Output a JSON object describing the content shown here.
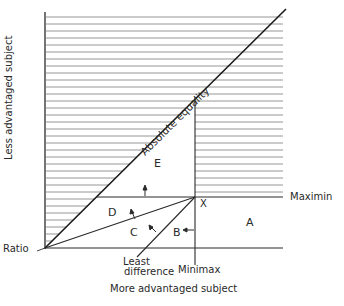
{
  "diagram": {
    "type": "distributive-justice-regions",
    "axes": {
      "x_label": "More advantaged subject",
      "y_label": "Less advantaged subject"
    },
    "lines": {
      "diagonal": "Absolute equality",
      "horizontal": "Maximin",
      "vertical": "Minimax",
      "least_difference": "Least difference",
      "origin": "Ratio"
    },
    "point": "X",
    "regions": [
      "A",
      "B",
      "C",
      "D",
      "E"
    ],
    "least_difference_line1": "Least",
    "least_difference_line2": "difference",
    "colors": {
      "ink": "#2a2a2a",
      "hatch": "#7a7a7a",
      "background": "#ffffff"
    }
  }
}
